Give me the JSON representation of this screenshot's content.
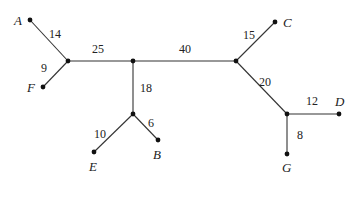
{
  "diagram": {
    "type": "weighted-tree",
    "nodes": [
      {
        "id": "A",
        "label": "A",
        "x": 30,
        "y": 20,
        "lx": 14,
        "ly": 25
      },
      {
        "id": "F",
        "label": "F",
        "x": 43,
        "y": 87,
        "lx": 27,
        "ly": 92
      },
      {
        "id": "C",
        "label": "C",
        "x": 275,
        "y": 22,
        "lx": 283,
        "ly": 27
      },
      {
        "id": "D",
        "label": "D",
        "x": 339,
        "y": 114,
        "lx": 335,
        "ly": 106
      },
      {
        "id": "G",
        "label": "G",
        "x": 287,
        "y": 154,
        "lx": 282,
        "ly": 172
      },
      {
        "id": "E",
        "label": "E",
        "x": 94,
        "y": 152,
        "lx": 89,
        "ly": 171
      },
      {
        "id": "B",
        "label": "B",
        "x": 158,
        "y": 140,
        "lx": 153,
        "ly": 159
      },
      {
        "id": "J1",
        "label": "",
        "x": 68,
        "y": 61
      },
      {
        "id": "J2",
        "label": "",
        "x": 133,
        "y": 61
      },
      {
        "id": "J3",
        "label": "",
        "x": 236,
        "y": 61
      },
      {
        "id": "J4",
        "label": "",
        "x": 287,
        "y": 114
      },
      {
        "id": "J5",
        "label": "",
        "x": 133,
        "y": 114
      }
    ],
    "edges": [
      {
        "from": "A",
        "to": "J1",
        "weight": "14",
        "wx": 49,
        "wy": 38
      },
      {
        "from": "F",
        "to": "J1",
        "weight": "9",
        "wx": 41,
        "wy": 72
      },
      {
        "from": "J1",
        "to": "J2",
        "weight": "25",
        "wx": 92,
        "wy": 53
      },
      {
        "from": "J2",
        "to": "J3",
        "weight": "40",
        "wx": 179,
        "wy": 53
      },
      {
        "from": "J3",
        "to": "C",
        "weight": "15",
        "wx": 243,
        "wy": 39
      },
      {
        "from": "J3",
        "to": "J4",
        "weight": "20",
        "wx": 259,
        "wy": 86
      },
      {
        "from": "J4",
        "to": "D",
        "weight": "12",
        "wx": 306,
        "wy": 105
      },
      {
        "from": "J4",
        "to": "G",
        "weight": "8",
        "wx": 297,
        "wy": 139
      },
      {
        "from": "J2",
        "to": "J5",
        "weight": "18",
        "wx": 140,
        "wy": 92
      },
      {
        "from": "J5",
        "to": "E",
        "weight": "10",
        "wx": 94,
        "wy": 138
      },
      {
        "from": "J5",
        "to": "B",
        "weight": "6",
        "wx": 148,
        "wy": 127
      }
    ]
  }
}
